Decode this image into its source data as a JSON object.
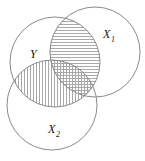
{
  "figure": {
    "name": "venn-diagram",
    "width": 145,
    "height": 161,
    "background": "#ffffff",
    "stroke_color": "#8a8a8a",
    "hatch_color": "#a8a8a8",
    "label_color": "#1a1a1a"
  },
  "circles": [
    {
      "id": "Y",
      "label": "Y",
      "label_sub": "",
      "cx": 55,
      "cy": 62,
      "r": 45,
      "label_x": 30,
      "label_y": 58
    },
    {
      "id": "X1",
      "label": "X",
      "label_sub": "1",
      "cx": 95,
      "cy": 52,
      "r": 45,
      "label_x": 103,
      "label_y": 38
    },
    {
      "id": "X2",
      "label": "X",
      "label_sub": "2",
      "cx": 52,
      "cy": 105,
      "r": 45,
      "label_x": 48,
      "label_y": 133
    }
  ],
  "shaded_regions": [
    {
      "id": "Y-cap-X1",
      "name": "intersection-y-x1",
      "hatch": "horizontal",
      "hatch_spacing": 3,
      "description": "Y intersect X1"
    },
    {
      "id": "Y-cap-X2",
      "name": "intersection-y-x2",
      "hatch": "vertical",
      "hatch_spacing": 3,
      "description": "Y intersect X2"
    }
  ]
}
